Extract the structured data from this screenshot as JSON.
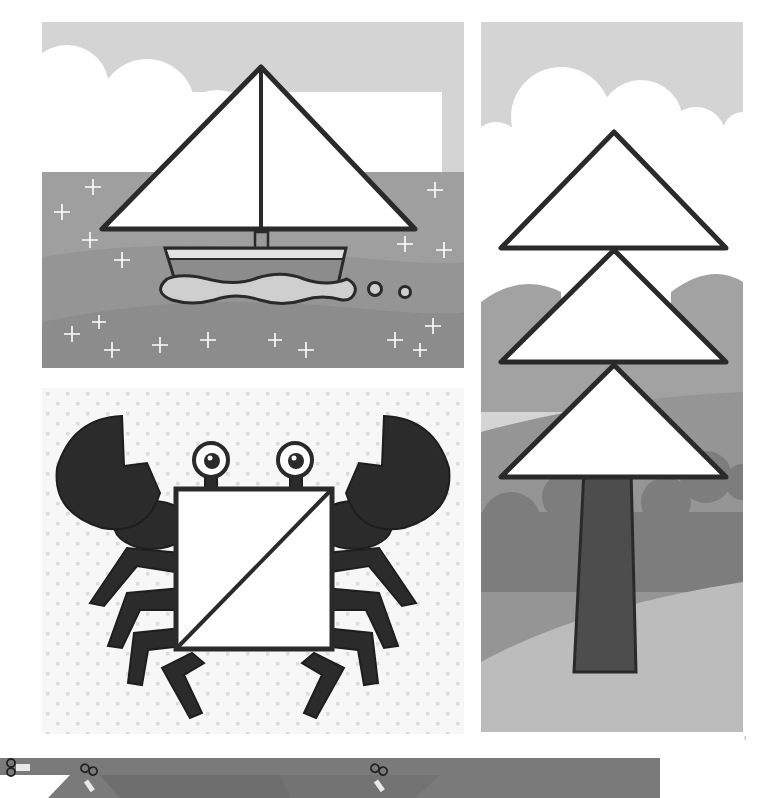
{
  "page": {
    "page_mark": "ı"
  },
  "colors": {
    "sky": "#d4d4d4",
    "cloud": "#ffffff",
    "sea_light": "#9f9f9f",
    "sea_mid": "#939393",
    "sea_dark": "#8a8a8a",
    "outline": "#2a2a2a",
    "shape_fill": "#ffffff",
    "hull_stripe": "#e2e2e2",
    "hull_body": "#8c8c8c",
    "wave_fill": "#cfcfcf",
    "hill_back": "#a2a2a2",
    "hill_mid": "#8e8e8e",
    "bush": "#7b7b7b",
    "ground": "#bcbcbc",
    "trunk": "#4d4d4d",
    "crab_body": "#2b2b2b",
    "dot_bg": "#f7f7f7",
    "dot": "#dcdcdc",
    "strip": "#7a7a7a",
    "strip_dark": "#6a6a6a"
  },
  "panels": [
    {
      "id": "boat",
      "subject": "sailboat",
      "shapes": [
        "triangle",
        "trapezoid"
      ],
      "sparkle_count": 20
    },
    {
      "id": "crab",
      "subject": "crab",
      "shapes": [
        "square",
        "triangle",
        "triangle"
      ]
    },
    {
      "id": "tree",
      "subject": "pine tree",
      "shapes": [
        "triangle",
        "triangle",
        "triangle",
        "trapezoid"
      ]
    }
  ],
  "cut_strip": {
    "icons": [
      "scissors-icon",
      "scissors-icon",
      "scissors-icon"
    ]
  }
}
